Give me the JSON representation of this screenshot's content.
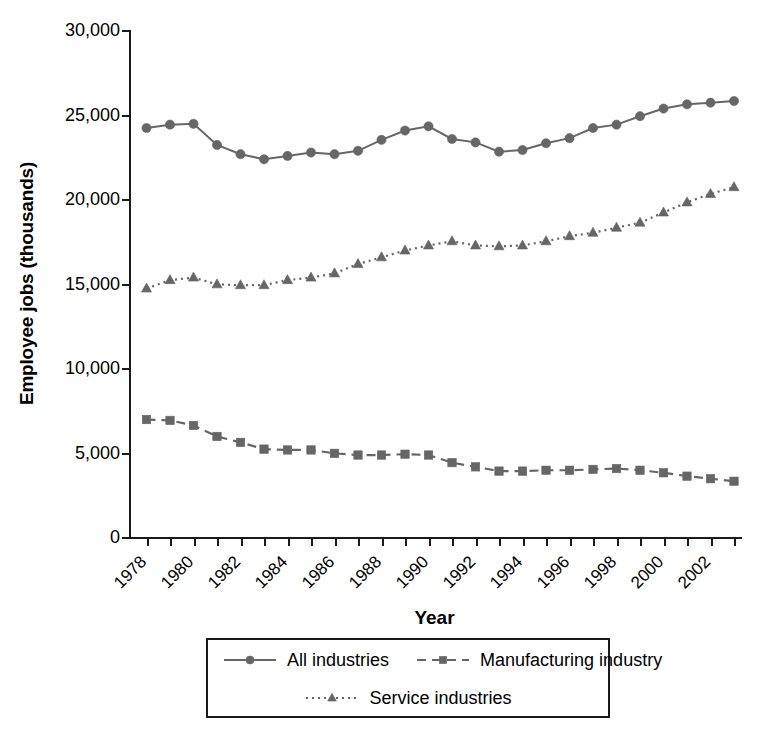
{
  "chart_data": {
    "type": "line",
    "title": "",
    "xlabel": "Year",
    "ylabel": "Employee jobs (thousands)",
    "xlim": [
      1978,
      2003
    ],
    "ylim": [
      0,
      30000
    ],
    "ytick_values": [
      0,
      5000,
      10000,
      15000,
      20000,
      25000,
      30000
    ],
    "ytick_labels": [
      "0",
      "5,000",
      "10,000",
      "15,000",
      "20,000",
      "25,000",
      "30,000"
    ],
    "x": [
      1978,
      1979,
      1980,
      1981,
      1982,
      1983,
      1984,
      1985,
      1986,
      1987,
      1988,
      1989,
      1990,
      1991,
      1992,
      1993,
      1994,
      1995,
      1996,
      1997,
      1998,
      1999,
      2000,
      2001,
      2002,
      2003
    ],
    "xtick_labels": [
      "1978",
      "",
      "1980",
      "",
      "1982",
      "",
      "1984",
      "",
      "1986",
      "",
      "1988",
      "",
      "1990",
      "",
      "1992",
      "",
      "1994",
      "",
      "1996",
      "",
      "1998",
      "",
      "2000",
      "",
      "2002",
      ""
    ],
    "grid": false,
    "legend_position": "bottom",
    "series": [
      {
        "name": "All industries",
        "marker": "circle",
        "line_style": "solid",
        "color": "#666666",
        "values": [
          24200,
          24400,
          24450,
          23200,
          22650,
          22350,
          22550,
          22750,
          22650,
          22850,
          23500,
          24050,
          24300,
          23550,
          23350,
          22800,
          22900,
          23300,
          23600,
          24200,
          24400,
          24900,
          25350,
          25600,
          25700,
          25800
        ]
      },
      {
        "name": "Manufacturing industry",
        "marker": "square",
        "line_style": "dashed",
        "color": "#666666",
        "values": [
          6950,
          6900,
          6600,
          5950,
          5600,
          5200,
          5150,
          5150,
          4950,
          4850,
          4850,
          4900,
          4850,
          4400,
          4150,
          3900,
          3900,
          3950,
          3950,
          4000,
          4050,
          3950,
          3800,
          3600,
          3450,
          3300
        ]
      },
      {
        "name": "Service industries",
        "marker": "triangle",
        "line_style": "dotted",
        "color": "#666666",
        "values": [
          14700,
          15200,
          15350,
          14950,
          14900,
          14900,
          15200,
          15350,
          15600,
          16150,
          16550,
          16950,
          17250,
          17500,
          17250,
          17200,
          17250,
          17500,
          17800,
          18000,
          18300,
          18600,
          19200,
          19800,
          20300,
          20700
        ]
      }
    ]
  },
  "legend": {
    "entries": [
      {
        "label": "All industries"
      },
      {
        "label": "Manufacturing industry"
      },
      {
        "label": "Service industries"
      }
    ]
  }
}
